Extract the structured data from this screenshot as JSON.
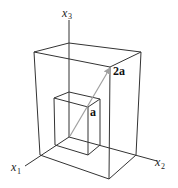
{
  "diagram": {
    "title": "",
    "axes": [
      {
        "name": "x1",
        "label": "x",
        "subscript": "1"
      },
      {
        "name": "x2",
        "label": "x",
        "subscript": "2"
      },
      {
        "name": "x3",
        "label": "x",
        "subscript": "3"
      }
    ],
    "vectors": [
      {
        "name": "a",
        "label": "a"
      },
      {
        "name": "2a",
        "label": "2a"
      }
    ],
    "boxes": [
      {
        "name": "inner-box",
        "scale": "a"
      },
      {
        "name": "outer-box",
        "scale": "2a"
      }
    ],
    "colors": {
      "edges": "#333333",
      "vector": "#a0a0a0",
      "background": "#ffffff"
    }
  }
}
